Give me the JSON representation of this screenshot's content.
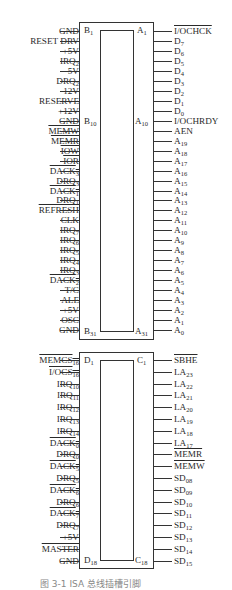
{
  "figure": {
    "caption": "图 3-1  ISA 总线插槽引脚",
    "connector_top": {
      "corner_labels": {
        "b_first": "B",
        "b_first_sub": "1",
        "b_mid": "B",
        "b_mid_sub": "10",
        "b_last": "B",
        "b_last_sub": "31",
        "a_first": "A",
        "a_first_sub": "1",
        "a_mid": "A",
        "a_mid_sub": "10",
        "a_last": "A",
        "a_last_sub": "31"
      },
      "left_pins": [
        {
          "t": "GND",
          "s": "",
          "o": false
        },
        {
          "t": "RESET DRV",
          "s": "",
          "o": false
        },
        {
          "t": "+5V",
          "s": "",
          "o": false
        },
        {
          "t": "IRQ",
          "s": "2",
          "o": false
        },
        {
          "t": "-5V",
          "s": "",
          "o": false
        },
        {
          "t": "DRQ",
          "s": "2",
          "o": false
        },
        {
          "t": "-12V",
          "s": "",
          "o": false
        },
        {
          "t": "RESERVE",
          "s": "",
          "o": false
        },
        {
          "t": "+12V",
          "s": "",
          "o": false
        },
        {
          "t": "GND",
          "s": "",
          "o": false
        },
        {
          "t": "MEMW",
          "s": "",
          "o": true
        },
        {
          "t": "MEMR",
          "s": "",
          "o": true
        },
        {
          "t": "IOW",
          "s": "",
          "o": true
        },
        {
          "t": "IOR",
          "s": "",
          "o": true
        },
        {
          "t": "DACK",
          "s": "3",
          "o": true
        },
        {
          "t": "DRQ",
          "s": "3",
          "o": false
        },
        {
          "t": "DACK",
          "s": "1",
          "o": true
        },
        {
          "t": "DRQ",
          "s": "1",
          "o": false
        },
        {
          "t": "REFRESH",
          "s": "",
          "o": true
        },
        {
          "t": "CLK",
          "s": "",
          "o": false
        },
        {
          "t": "IRQ",
          "s": "7",
          "o": false
        },
        {
          "t": "IRQ",
          "s": "6",
          "o": false
        },
        {
          "t": "IRQ",
          "s": "5",
          "o": false
        },
        {
          "t": "IRQ",
          "s": "4",
          "o": false
        },
        {
          "t": "IRQ",
          "s": "3",
          "o": false
        },
        {
          "t": "DACK",
          "s": "2",
          "o": true
        },
        {
          "t": "T/C",
          "s": "",
          "o": false
        },
        {
          "t": "ALE",
          "s": "",
          "o": false
        },
        {
          "t": "+5V",
          "s": "",
          "o": false
        },
        {
          "t": "OSC",
          "s": "",
          "o": false
        },
        {
          "t": "GND",
          "s": "",
          "o": false
        }
      ],
      "right_pins": [
        {
          "t": "I/OCHCK",
          "s": "",
          "o": true
        },
        {
          "t": "D",
          "s": "7",
          "o": false
        },
        {
          "t": "D",
          "s": "6",
          "o": false
        },
        {
          "t": "D",
          "s": "5",
          "o": false
        },
        {
          "t": "D",
          "s": "4",
          "o": false
        },
        {
          "t": "D",
          "s": "3",
          "o": false
        },
        {
          "t": "D",
          "s": "2",
          "o": false
        },
        {
          "t": "D",
          "s": "1",
          "o": false
        },
        {
          "t": "D",
          "s": "0",
          "o": false
        },
        {
          "t": "I/OCHRDY",
          "s": "",
          "o": false
        },
        {
          "t": "AEN",
          "s": "",
          "o": false
        },
        {
          "t": "A",
          "s": "19",
          "o": false
        },
        {
          "t": "A",
          "s": "18",
          "o": false
        },
        {
          "t": "A",
          "s": "17",
          "o": false
        },
        {
          "t": "A",
          "s": "16",
          "o": false
        },
        {
          "t": "A",
          "s": "15",
          "o": false
        },
        {
          "t": "A",
          "s": "14",
          "o": false
        },
        {
          "t": "A",
          "s": "13",
          "o": false
        },
        {
          "t": "A",
          "s": "12",
          "o": false
        },
        {
          "t": "A",
          "s": "11",
          "o": false
        },
        {
          "t": "A",
          "s": "10",
          "o": false
        },
        {
          "t": "A",
          "s": "9",
          "o": false
        },
        {
          "t": "A",
          "s": "8",
          "o": false
        },
        {
          "t": "A",
          "s": "7",
          "o": false
        },
        {
          "t": "A",
          "s": "6",
          "o": false
        },
        {
          "t": "A",
          "s": "5",
          "o": false
        },
        {
          "t": "A",
          "s": "4",
          "o": false
        },
        {
          "t": "A",
          "s": "3",
          "o": false
        },
        {
          "t": "A",
          "s": "2",
          "o": false
        },
        {
          "t": "A",
          "s": "1",
          "o": false
        },
        {
          "t": "A",
          "s": "0",
          "o": false
        }
      ]
    },
    "connector_bottom": {
      "corner_labels": {
        "d_first": "D",
        "d_first_sub": "1",
        "d_last": "D",
        "d_last_sub": "18",
        "c_first": "C",
        "c_first_sub": "1",
        "c_last": "C",
        "c_last_sub": "18"
      },
      "left_pins": [
        {
          "t": "MEMCS",
          "s": "16",
          "o": true
        },
        {
          "t": "I/OCS",
          "s": "16",
          "o": true
        },
        {
          "t": "IRQ",
          "s": "10",
          "o": false
        },
        {
          "t": "IRQ",
          "s": "11",
          "o": false
        },
        {
          "t": "IRQ",
          "s": "12",
          "o": false
        },
        {
          "t": "IRQ",
          "s": "13",
          "o": false
        },
        {
          "t": "IRQ",
          "s": "14",
          "o": false
        },
        {
          "t": "DACK",
          "s": "0",
          "o": true
        },
        {
          "t": "DRQ",
          "s": "0",
          "o": false
        },
        {
          "t": "DACK",
          "s": "5",
          "o": true
        },
        {
          "t": "DRQ",
          "s": "5",
          "o": false
        },
        {
          "t": "DACK",
          "s": "6",
          "o": true
        },
        {
          "t": "DRQ",
          "s": "6",
          "o": false
        },
        {
          "t": "DACK",
          "s": "7",
          "o": true
        },
        {
          "t": "DRQ",
          "s": "7",
          "o": false
        },
        {
          "t": "+5V",
          "s": "",
          "o": false
        },
        {
          "t": "MASTER",
          "s": "",
          "o": true
        },
        {
          "t": "GND",
          "s": "",
          "o": false
        }
      ],
      "right_pins": [
        {
          "t": "SBHE",
          "s": "",
          "o": true
        },
        {
          "t": "LA",
          "s": "23",
          "o": false
        },
        {
          "t": "LA",
          "s": "22",
          "o": false
        },
        {
          "t": "LA",
          "s": "21",
          "o": false
        },
        {
          "t": "LA",
          "s": "20",
          "o": false
        },
        {
          "t": "LA",
          "s": "19",
          "o": false
        },
        {
          "t": "LA",
          "s": "18",
          "o": false
        },
        {
          "t": "LA",
          "s": "17",
          "o": false
        },
        {
          "t": "MEMR",
          "s": "",
          "o": true
        },
        {
          "t": "MEMW",
          "s": "",
          "o": true
        },
        {
          "t": "SD",
          "s": "08",
          "o": false
        },
        {
          "t": "SD",
          "s": "09",
          "o": false
        },
        {
          "t": "SD",
          "s": "10",
          "o": false
        },
        {
          "t": "SD",
          "s": "11",
          "o": false
        },
        {
          "t": "SD",
          "s": "12",
          "o": false
        },
        {
          "t": "SD",
          "s": "13",
          "o": false
        },
        {
          "t": "SD",
          "s": "14",
          "o": false
        },
        {
          "t": "SD",
          "s": "15",
          "o": false
        }
      ]
    }
  }
}
